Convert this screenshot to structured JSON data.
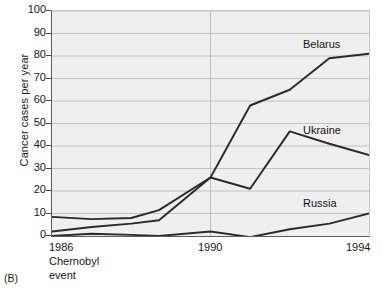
{
  "panel_label": "(B)",
  "axes": {
    "ylabel": "Cancer cases per year",
    "yticks": [
      "0",
      "10",
      "20",
      "30",
      "40",
      "50",
      "60",
      "70",
      "80",
      "90",
      "100"
    ],
    "xticks": [
      "1986",
      "1990",
      "1994"
    ],
    "annotation_line1": "Chernobyl",
    "annotation_line2": "event"
  },
  "series_labels": {
    "belarus": "Belarus",
    "ukraine": "Ukraine",
    "russia": "Russia"
  },
  "colors": {
    "plot_background": "#efefef",
    "gridline": "#b8b8b8",
    "line": "#2a2a2a",
    "axis": "#5d5d5d",
    "text": "#161616"
  },
  "chart_data": {
    "type": "line",
    "title": "",
    "xlabel": "",
    "ylabel": "Cancer cases per year",
    "xlim": [
      1986,
      1994
    ],
    "ylim": [
      0,
      100
    ],
    "ytick_step": 10,
    "grid": true,
    "legend": "inline-series-labels",
    "x": [
      1986,
      1987,
      1988,
      1988.7,
      1990,
      1991,
      1992,
      1993,
      1994
    ],
    "series": [
      {
        "name": "Belarus",
        "values": [
          8.5,
          7.5,
          8.0,
          11.5,
          26.0,
          58.0,
          65.0,
          79.0,
          81.0
        ]
      },
      {
        "name": "Ukraine",
        "values": [
          2.0,
          4.0,
          5.5,
          7.0,
          26.0,
          21.0,
          46.5,
          41.0,
          36.0
        ]
      },
      {
        "name": "Russia",
        "values": [
          0.0,
          1.0,
          0.5,
          0.0,
          2.0,
          -0.5,
          3.0,
          5.5,
          10.0
        ]
      }
    ],
    "annotations": [
      {
        "text": "Chernobyl event",
        "x": 1986,
        "note": "marks Chernobyl disaster at start of x-axis"
      }
    ]
  }
}
